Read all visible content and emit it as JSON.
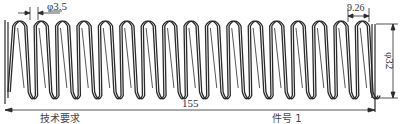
{
  "drawing": {
    "type": "compression-spring-technical-drawing",
    "stroke_color": "#2a2a2a",
    "background": "#ffffff",
    "spring": {
      "x_start": 8,
      "x_end": 372,
      "top_y": 20,
      "bottom_y": 98,
      "coil_count": 17
    },
    "dimensions": {
      "wire_diameter": {
        "label": "φ3.5"
      },
      "pitch": {
        "label": "9.26"
      },
      "outer_diameter": {
        "label": "φ32"
      },
      "free_length": {
        "label": "155"
      }
    },
    "bottom_labels": {
      "left": "技术要求",
      "right": "件号  1"
    }
  }
}
